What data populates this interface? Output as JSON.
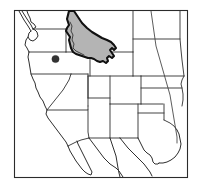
{
  "figure": {
    "type": "range-map",
    "region": "Western United States",
    "background_color": "#ffffff",
    "frame": {
      "x": 14,
      "y": 10,
      "width": 174,
      "height": 168,
      "stroke_color": "#2b2b2b"
    }
  },
  "legend_semantics": {
    "shaded_area_label": "Shaded distribution range",
    "shaded_fill_color": "#b4b4b4",
    "shaded_outline_color": "#111111",
    "dot_label": "Locality record",
    "dot_color": "#333333",
    "state_boundary_color": "#3a3a3a",
    "coastline_color": "#2e2e2e",
    "river_color": "#3f3f3f"
  },
  "range_polygon": {
    "name": "shaded-range-idaho",
    "description": "Shaded range covering Idaho and extending east into southwestern Montana and northwestern Wyoming"
  },
  "locality_points": [
    {
      "name": "locality-dot-eastern-oregon",
      "cx": 55.5,
      "cy": 59.0,
      "r": 3.6,
      "state": "Oregon"
    }
  ],
  "states": [
    {
      "name": "washington"
    },
    {
      "name": "oregon"
    },
    {
      "name": "idaho"
    },
    {
      "name": "montana"
    },
    {
      "name": "wyoming"
    },
    {
      "name": "north-dakota"
    },
    {
      "name": "south-dakota"
    },
    {
      "name": "nebraska"
    },
    {
      "name": "kansas"
    },
    {
      "name": "oklahoma"
    },
    {
      "name": "california"
    },
    {
      "name": "nevada"
    },
    {
      "name": "utah"
    },
    {
      "name": "colorado"
    },
    {
      "name": "arizona"
    },
    {
      "name": "new-mexico"
    },
    {
      "name": "texas"
    },
    {
      "name": "baja-california"
    }
  ],
  "water_features": [
    {
      "name": "pacific-coast"
    },
    {
      "name": "gulf-of-california"
    },
    {
      "name": "missouri-river"
    },
    {
      "name": "rio-grande"
    },
    {
      "name": "gulf-of-mexico-coast"
    },
    {
      "name": "puget-sound"
    }
  ]
}
